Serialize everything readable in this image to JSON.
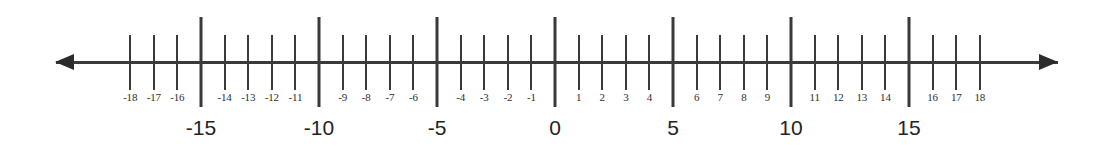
{
  "figure": {
    "line_color": "#3a3a3a",
    "label_color": "#2e2e2e",
    "major_label_color": "#232323",
    "background": "#ffffff"
  },
  "chart_data": {
    "type": "number-line",
    "title": "",
    "xlabel": "",
    "ylabel": "",
    "xlim": [
      -19.5,
      19.5
    ],
    "axis_range_labeled": [
      -18,
      18
    ],
    "unit_spacing_px": 23.6,
    "origin_x_px": 555,
    "grid": false,
    "legend": null,
    "arrows": [
      {
        "name": "left-arrow",
        "direction": "left",
        "glyph": "◀"
      },
      {
        "name": "right-arrow",
        "direction": "right",
        "glyph": "▶"
      }
    ],
    "major_ticks": {
      "values": [
        -15,
        -10,
        -5,
        0,
        5,
        10,
        15
      ],
      "labels": [
        "-15",
        "-10",
        "-5",
        "0",
        "5",
        "10",
        "15"
      ],
      "step": 5
    },
    "minor_ticks": {
      "values": [
        -18,
        -17,
        -16,
        -14,
        -13,
        -12,
        -11,
        -9,
        -8,
        -7,
        -6,
        -4,
        -3,
        -2,
        -1,
        1,
        2,
        3,
        4,
        6,
        7,
        8,
        9,
        11,
        12,
        13,
        14,
        16,
        17,
        18
      ],
      "labels": [
        "-18",
        "-17",
        "-16",
        "-14",
        "-13",
        "-12",
        "-11",
        "-9",
        "-8",
        "-7",
        "-6",
        "-4",
        "-3",
        "-2",
        "-1",
        "1",
        "2",
        "3",
        "4",
        "6",
        "7",
        "8",
        "9",
        "11",
        "12",
        "13",
        "14",
        "16",
        "17",
        "18"
      ],
      "step": 1
    }
  }
}
